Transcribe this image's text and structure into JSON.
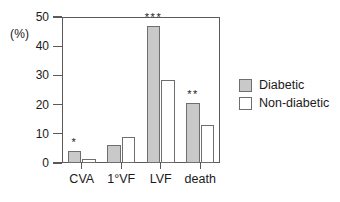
{
  "chart_data": {
    "type": "bar",
    "title": "",
    "subtitle": "",
    "xlabel": "",
    "ylabel": "(%)",
    "categories": [
      "CVA",
      "1°VF",
      "LVF",
      "death"
    ],
    "series": [
      {
        "name": "Diabetic",
        "color": "#c9c9c9",
        "values": [
          4,
          6,
          47,
          20.5
        ]
      },
      {
        "name": "Non-diabetic",
        "color": "#ffffff",
        "values": [
          1.5,
          9,
          28.5,
          13
        ]
      }
    ],
    "annotations": [
      {
        "category": "CVA",
        "text": "*"
      },
      {
        "category": "1°VF",
        "text": ""
      },
      {
        "category": "LVF",
        "text": "***"
      },
      {
        "category": "death",
        "text": "**"
      }
    ],
    "ylim": [
      0,
      50
    ],
    "yticks": [
      0,
      10,
      20,
      30,
      40,
      50
    ],
    "ytick_labels": [
      "0",
      "10",
      "20",
      "30",
      "40",
      "50"
    ],
    "grid": false,
    "legend_position": "right"
  },
  "legend": {
    "entries": [
      {
        "label": "Diabetic"
      },
      {
        "label": "Non-diabetic"
      }
    ]
  }
}
